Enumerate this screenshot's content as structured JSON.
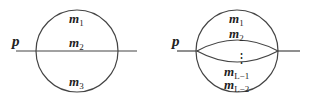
{
  "diagrams": [
    {
      "name": "sunset-diagram",
      "momentum_label": "p",
      "masses": [
        {
          "base": "m",
          "sub": "1"
        },
        {
          "base": "m",
          "sub": "2"
        },
        {
          "base": "m",
          "sub": "3"
        }
      ]
    },
    {
      "name": "banana-diagram",
      "momentum_label": "p",
      "masses": [
        {
          "base": "m",
          "sub": "1"
        },
        {
          "base": "m",
          "sub": "2"
        },
        {
          "base": "m",
          "sub": "L−1"
        },
        {
          "base": "m",
          "sub": "L−2"
        }
      ],
      "ellipsis": "⋮"
    }
  ],
  "colors": {
    "line": "#444444",
    "text": "#222222",
    "background": "#ffffff"
  }
}
